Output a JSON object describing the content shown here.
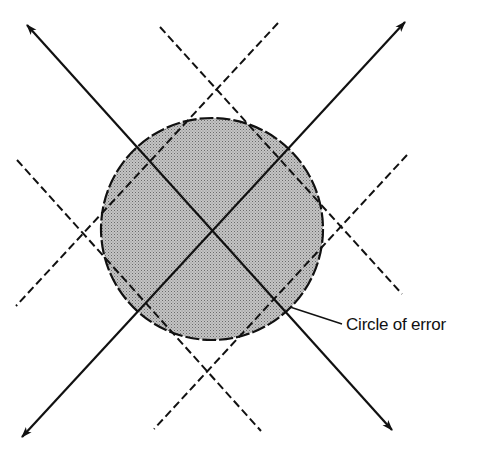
{
  "diagram": {
    "type": "circle-of-error",
    "label": "Circle of error",
    "colors": {
      "background": "#ffffff",
      "ink": "#111111",
      "circle_fill": "#b9b9b9"
    },
    "circle": {
      "cx": 212,
      "cy": 229,
      "r": 111
    },
    "solid_lines": [
      {
        "name": "line-nw-se",
        "x1": 27,
        "y1": 25,
        "x2": 392,
        "y2": 430,
        "arrows": [
          "start",
          "end"
        ]
      },
      {
        "name": "line-ne-sw",
        "x1": 405,
        "y1": 22,
        "x2": 22,
        "y2": 437,
        "arrows": [
          "start",
          "end"
        ]
      }
    ],
    "dashed_lines": [
      {
        "name": "dashed-nw-se-upper",
        "x1": 160,
        "y1": 27,
        "x2": 402,
        "y2": 294
      },
      {
        "name": "dashed-nw-se-lower",
        "x1": 17,
        "y1": 160,
        "x2": 261,
        "y2": 431
      },
      {
        "name": "dashed-ne-sw-upper",
        "x1": 278,
        "y1": 23,
        "x2": 16,
        "y2": 306
      },
      {
        "name": "dashed-ne-sw-lower",
        "x1": 407,
        "y1": 155,
        "x2": 154,
        "y2": 429
      }
    ],
    "leader_line": {
      "x1": 290,
      "y1": 307,
      "x2": 342,
      "y2": 324
    }
  }
}
